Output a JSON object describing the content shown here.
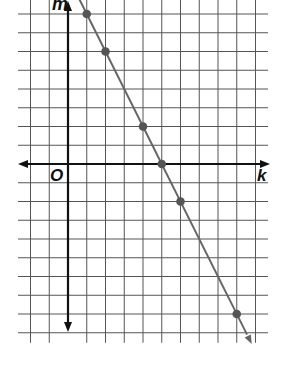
{
  "chart_data": {
    "type": "line",
    "title": "",
    "xlabel": "k",
    "ylabel": "m",
    "origin_label": "O",
    "xlim": [
      -2,
      10
    ],
    "ylim": [
      -9,
      8
    ],
    "grid": true,
    "grid_step": 1,
    "tick_labels_shown": false,
    "series": [
      {
        "name": "line",
        "equation": "m = -2k + 10",
        "points": [
          {
            "k": 1,
            "m": 8
          },
          {
            "k": 2,
            "m": 6
          },
          {
            "k": 4,
            "m": 2
          },
          {
            "k": 5,
            "m": 0
          },
          {
            "k": 6,
            "m": -2
          },
          {
            "k": 9,
            "m": -8
          }
        ]
      }
    ]
  },
  "labels": {
    "y_axis": "m",
    "x_axis": "k",
    "origin": "O"
  },
  "colors": {
    "grid": "#555555",
    "axis": "#111111",
    "line": "#666666",
    "point": "#555555"
  }
}
